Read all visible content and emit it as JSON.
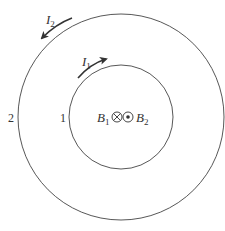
{
  "diagram": {
    "loops": [
      {
        "id": "loop-1",
        "label": "1",
        "current_label": "I",
        "current_sub": "1",
        "direction": "clockwise",
        "cx": 121,
        "cy": 117,
        "r": 52
      },
      {
        "id": "loop-2",
        "label": "2",
        "current_label": "I",
        "current_sub": "2",
        "direction": "counterclockwise",
        "cx": 121,
        "cy": 117,
        "r": 103
      }
    ],
    "center": {
      "field_1": {
        "symbol": "B",
        "sub": "1",
        "direction": "into page",
        "glyph": "circle-cross"
      },
      "field_2": {
        "symbol": "B",
        "sub": "2",
        "direction": "out of page",
        "glyph": "circle-dot"
      }
    },
    "colors": {
      "stroke": "#333333",
      "background": "#ffffff"
    }
  }
}
